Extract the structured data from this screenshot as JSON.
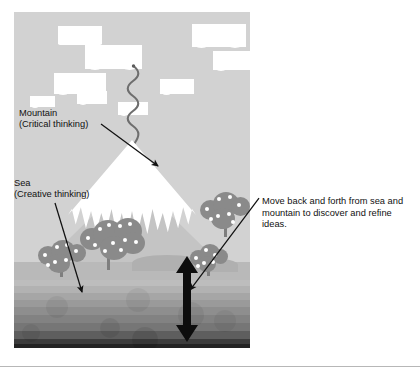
{
  "figure": {
    "alt_title": "Mountain and sea metaphor for critical and creative thinking"
  },
  "panel": {
    "sky_color": "#d2d2d2",
    "mountain_snow_color": "#ffffff",
    "mountain_base_color": "#c4c4c4",
    "ground_color": "#b9b9b9",
    "tree_color": "#8a8a8a",
    "tree_dot_color": "#ffffff",
    "arrow_color": "#111111",
    "sea_bands": [
      "#bdbdbd",
      "#b2b2b2",
      "#a6a6a6",
      "#9a9a9a",
      "#8e8e8e",
      "#828282",
      "#767676",
      "#5e5e5e",
      "#3c3c3c",
      "#232323"
    ]
  },
  "labels": {
    "mountain": "Mountain\n(Critical thinking)",
    "sea": "Sea\n(Creative thinking)",
    "note": "Move back and forth from sea and mountain to discover and refine ideas."
  },
  "caption": {
    "text": ""
  },
  "icons": {
    "mountain_pointer": "arrow-down-right-icon",
    "sea_pointer": "arrow-down-right-icon",
    "note_pointer": "arrow-down-left-icon",
    "oscillation": "double-headed-vertical-arrow-icon",
    "smoke": "wavy-line-icon"
  }
}
